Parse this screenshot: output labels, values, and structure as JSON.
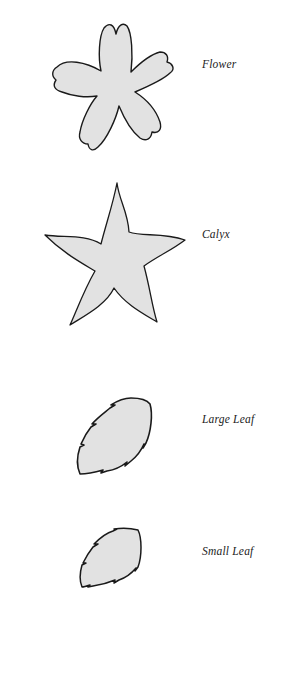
{
  "colors": {
    "fill": "#e2e2e2",
    "stroke": "#1a1a1a",
    "background": "#ffffff"
  },
  "templates": [
    {
      "id": "flower",
      "label": "Flower",
      "icon": "flower-shape"
    },
    {
      "id": "calyx",
      "label": "Calyx",
      "icon": "calyx-star-shape"
    },
    {
      "id": "large-leaf",
      "label": "Large Leaf",
      "icon": "serrated-leaf-shape"
    },
    {
      "id": "small-leaf",
      "label": "Small Leaf",
      "icon": "serrated-leaf-shape"
    }
  ]
}
